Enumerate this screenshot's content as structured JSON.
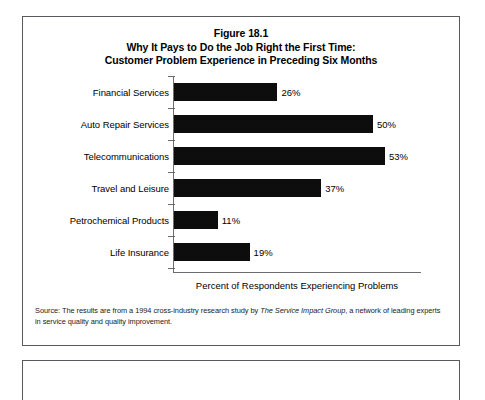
{
  "figure": {
    "title_lines": [
      "Figure 18.1",
      "Why It Pays to Do the Job Right the First Time:",
      "Customer Problem Experience in Preceding Six Months"
    ],
    "source_prefix": "Source: The results are from a 1994 cross-industry research study by ",
    "source_italic": "The Service Impact Group",
    "source_suffix": ", a network of leading experts in service quality and quality improvement."
  },
  "chart_data": {
    "type": "bar",
    "orientation": "horizontal",
    "xlabel": "Percent of Respondents Experiencing Problems",
    "ylabel": "",
    "categories": [
      "Financial Services",
      "Auto Repair Services",
      "Telecommunications",
      "Travel and Leisure",
      "Petrochemical Products",
      "Life Insurance"
    ],
    "values": [
      26,
      50,
      53,
      37,
      11,
      19
    ],
    "value_labels": [
      "26%",
      "50%",
      "53%",
      "37%",
      "11%",
      "19%"
    ],
    "xlim": [
      0,
      62
    ],
    "grid": false,
    "legend": null,
    "bar_color": "#0d0d0d",
    "axis_color": "#6b6b70"
  }
}
